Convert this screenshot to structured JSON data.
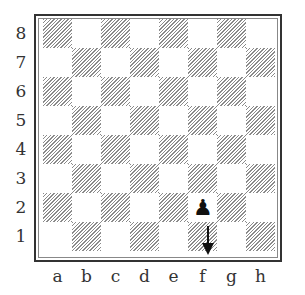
{
  "board": {
    "ranks": [
      "8",
      "7",
      "6",
      "5",
      "4",
      "3",
      "2",
      "1"
    ],
    "files": [
      "a",
      "b",
      "c",
      "d",
      "e",
      "f",
      "g",
      "h"
    ],
    "colors": {
      "dark_hatch": "#8a8a8a",
      "light": "#ffffff",
      "frame": "#333333"
    }
  },
  "pieces": [
    {
      "square": "f2",
      "type": "pawn",
      "color": "black",
      "glyph": "♟"
    }
  ],
  "arrows": [
    {
      "from": "f2",
      "to": "f1",
      "direction": "down",
      "color": "#111111"
    }
  ]
}
